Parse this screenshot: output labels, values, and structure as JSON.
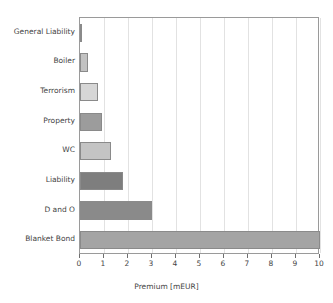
{
  "chart_data": {
    "type": "bar",
    "orientation": "horizontal",
    "title": "",
    "xlabel": "Premium [mEUR]",
    "ylabel": "",
    "categories": [
      "General Liability",
      "Boiler",
      "Terrorism",
      "Property",
      "WC",
      "Liability",
      "D and O",
      "Blanket Bond"
    ],
    "values": [
      0.07,
      0.35,
      0.75,
      0.9,
      1.3,
      1.8,
      3.0,
      10.0
    ],
    "bar_colors": [
      "#8c8c8c",
      "#c2c2c2",
      "#d6d6d6",
      "#9c9c9c",
      "#c4c4c4",
      "#7e7e7e",
      "#8a8a8a",
      "#a4a4a4"
    ],
    "xlim": [
      0,
      10
    ],
    "xticks": [
      0,
      1,
      2,
      3,
      4,
      5,
      6,
      7,
      8,
      9,
      10
    ],
    "xtick_labels": [
      "0",
      "1",
      "2",
      "3",
      "4",
      "5",
      "6",
      "7",
      "8",
      "9",
      "10"
    ],
    "grid": true,
    "grid_axis": "x",
    "legend": false,
    "axis_color": "#9a9a9a",
    "grid_color": "#e2e2e2",
    "text_color": "#444444",
    "background": "#ffffff"
  }
}
